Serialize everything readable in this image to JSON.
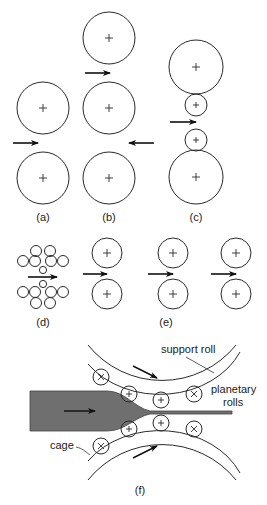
{
  "figure": {
    "panels": [
      {
        "id": "a",
        "label": "(a)",
        "description": "two-high rolling mill"
      },
      {
        "id": "b",
        "label": "(b)",
        "description": "three-high rolling mill"
      },
      {
        "id": "c",
        "label": "(c)",
        "description": "four-high rolling mill"
      },
      {
        "id": "d",
        "label": "(d)",
        "description": "cluster (Sendzimir) mill"
      },
      {
        "id": "e",
        "label": "(e)",
        "description": "tandem rolling mill"
      },
      {
        "id": "f",
        "label": "(f)",
        "description": "planetary rolling mill"
      }
    ],
    "annotations": {
      "support_roll": "support roll",
      "planetary_rolls_line1": "planetary",
      "planetary_rolls_line2": "rolls",
      "cage": "cage"
    },
    "colors": {
      "line": "#2a2a2a",
      "strip": "#6f6f6f",
      "background": "#ffffff"
    }
  }
}
